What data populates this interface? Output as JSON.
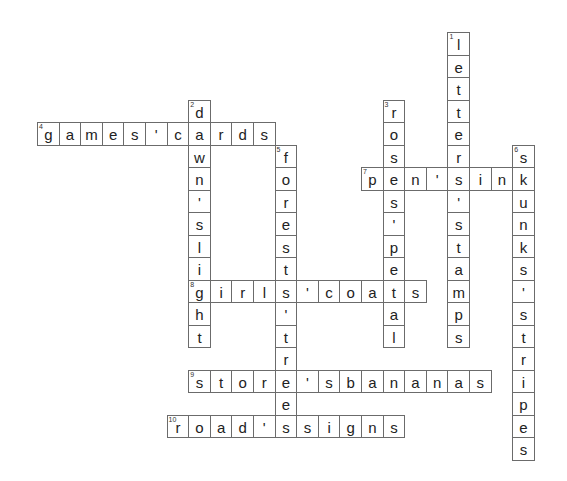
{
  "puzzle": {
    "grid": {
      "x0": 37,
      "y0": 32,
      "cell_w": 21.6,
      "cell_h": 22.5
    },
    "words": [
      {
        "number": 1,
        "direction": "down",
        "row": 0,
        "col": 19,
        "answer": "letters'stamps"
      },
      {
        "number": 2,
        "direction": "down",
        "row": 3,
        "col": 7,
        "answer": "dawn'slight"
      },
      {
        "number": 3,
        "direction": "down",
        "row": 3,
        "col": 16,
        "answer": "roses'petal"
      },
      {
        "number": 4,
        "direction": "across",
        "row": 4,
        "col": 0,
        "answer": "games'cards"
      },
      {
        "number": 5,
        "direction": "down",
        "row": 5,
        "col": 11,
        "answer": "forests'trees"
      },
      {
        "number": 6,
        "direction": "down",
        "row": 5,
        "col": 22,
        "answer": "skunks'stripes"
      },
      {
        "number": 7,
        "direction": "across",
        "row": 6,
        "col": 15,
        "answer": "pen'sink"
      },
      {
        "number": 8,
        "direction": "across",
        "row": 11,
        "col": 7,
        "answer": "girls'coats"
      },
      {
        "number": 9,
        "direction": "across",
        "row": 15,
        "col": 7,
        "answer": "store'sbananas"
      },
      {
        "number": 10,
        "direction": "across",
        "row": 17,
        "col": 6,
        "answer": "road'ssigns"
      }
    ]
  }
}
